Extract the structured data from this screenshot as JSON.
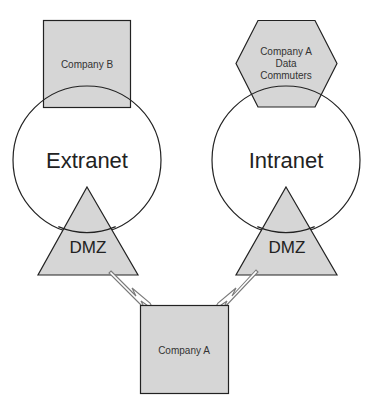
{
  "diagram": {
    "colors": {
      "shape_fill": "#d6d6d6",
      "stroke": "#222222",
      "bolt_fill": "#ffffff",
      "bolt_stroke": "#7a7a7a",
      "background": "#ffffff"
    },
    "nodes": {
      "company_b": {
        "label": "Company B",
        "shape": "square"
      },
      "data_commuters": {
        "lines": [
          "Company A",
          "Data",
          "Commuters"
        ],
        "shape": "hexagon"
      },
      "extranet": {
        "label": "Extranet",
        "shape": "circle"
      },
      "intranet": {
        "label": "Intranet",
        "shape": "circle"
      },
      "dmz_left": {
        "label": "DMZ",
        "shape": "triangle"
      },
      "dmz_right": {
        "label": "DMZ",
        "shape": "triangle"
      },
      "company_a": {
        "label": "Company A",
        "shape": "square"
      }
    },
    "connections": [
      {
        "from": "dmz_left",
        "to": "company_a",
        "type": "lightning-link"
      },
      {
        "from": "dmz_right",
        "to": "company_a",
        "type": "lightning-link"
      }
    ]
  }
}
